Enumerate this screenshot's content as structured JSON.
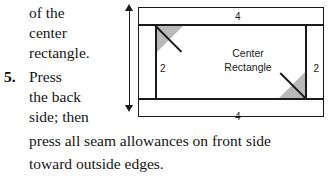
{
  "instructions": {
    "continuation_lines": [
      "of the",
      "center",
      "rectangle."
    ],
    "list_marker": "5.",
    "step_lines_narrow": [
      "Press",
      "the back",
      "side; then"
    ],
    "step_lines_wide": [
      "press all seam allowances on front side",
      "toward outside edges."
    ]
  },
  "diagram": {
    "center_label": "Center\nRectangle",
    "center_label_line1": "Center",
    "center_label_line2": "Rectangle",
    "dimensions": {
      "top": "4",
      "bottom": "4",
      "left": "2",
      "right": "2"
    },
    "icons": {
      "arrow_up": "arrow-up-icon",
      "arrow_down": "arrow-down-icon"
    },
    "colors": {
      "line": "#1a1a1a",
      "triangle_fill": "#b9b9b9",
      "background": "#ffffff"
    }
  }
}
